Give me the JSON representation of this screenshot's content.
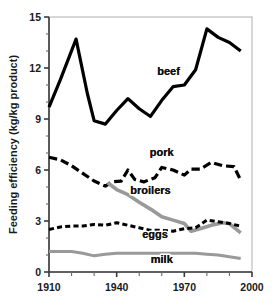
{
  "chart_data": {
    "type": "line",
    "title": "",
    "xlabel": "",
    "ylabel": "Feeding efficiency (kg/kg product)",
    "xlim": [
      1910,
      2000
    ],
    "ylim": [
      0,
      15
    ],
    "grid": false,
    "legend_position": "inline-labels",
    "x_ticks_major": [
      1910,
      1940,
      1970,
      2000
    ],
    "x_tick_labels": [
      "1910",
      "1940",
      "1970",
      "2000"
    ],
    "x_ticks_minor": [
      1920,
      1930,
      1950,
      1960,
      1980,
      1990
    ],
    "y_ticks_major": [
      0,
      3,
      6,
      9,
      12,
      15
    ],
    "y_tick_labels": [
      "0",
      "3",
      "6",
      "9",
      "12",
      "15"
    ],
    "y_ticks_minor": [
      1,
      2,
      4,
      5,
      7,
      8,
      10,
      11,
      13,
      14
    ],
    "series": [
      {
        "name": "beef",
        "color": "#000000",
        "style": "solid",
        "width": 3.2,
        "label_x": 1963,
        "label_y": 11.6,
        "x": [
          1910,
          1915,
          1922,
          1927,
          1930,
          1935,
          1940,
          1945,
          1950,
          1955,
          1960,
          1965,
          1970,
          1975,
          1980,
          1985,
          1990,
          1995
        ],
        "values": [
          9.7,
          11.3,
          13.7,
          10.5,
          8.9,
          8.7,
          9.5,
          10.2,
          9.6,
          9.15,
          10.1,
          10.9,
          11.0,
          11.9,
          14.3,
          13.8,
          13.5,
          13.0
        ]
      },
      {
        "name": "pork",
        "color": "#000000",
        "style": "long-dash",
        "width": 3.2,
        "label_x": 1960,
        "label_y": 6.8,
        "x": [
          1910,
          1915,
          1920,
          1925,
          1930,
          1935,
          1938,
          1942,
          1945,
          1948,
          1952,
          1957,
          1960,
          1965,
          1970,
          1973,
          1977,
          1982,
          1987,
          1992,
          1995
        ],
        "values": [
          6.75,
          6.6,
          6.25,
          5.8,
          5.35,
          5.05,
          5.3,
          5.35,
          6.0,
          5.45,
          5.3,
          5.55,
          6.15,
          6.0,
          5.7,
          6.05,
          6.05,
          6.45,
          6.25,
          6.2,
          5.4
        ]
      },
      {
        "name": "broilers",
        "color": "#999999",
        "style": "solid",
        "width": 3.6,
        "label_x": 1955,
        "label_y": 4.6,
        "x": [
          1936,
          1940,
          1945,
          1950,
          1955,
          1960,
          1965,
          1970,
          1973,
          1977,
          1982,
          1987,
          1990,
          1995
        ],
        "values": [
          5.25,
          4.85,
          4.55,
          4.1,
          3.7,
          3.25,
          3.05,
          2.85,
          2.4,
          2.55,
          2.75,
          2.9,
          2.85,
          2.3
        ]
      },
      {
        "name": "eggs",
        "color": "#000000",
        "style": "short-dash",
        "width": 3.0,
        "label_x": 1957,
        "label_y": 2.0,
        "x": [
          1910,
          1915,
          1920,
          1925,
          1930,
          1935,
          1940,
          1945,
          1950,
          1955,
          1960,
          1965,
          1970,
          1975,
          1980,
          1985,
          1990,
          1995
        ],
        "values": [
          2.5,
          2.65,
          2.7,
          2.7,
          2.8,
          2.75,
          2.9,
          2.75,
          2.6,
          2.45,
          2.45,
          2.4,
          2.55,
          2.6,
          3.05,
          2.95,
          2.85,
          2.7
        ]
      },
      {
        "name": "milk",
        "color": "#999999",
        "style": "solid",
        "width": 3.0,
        "label_x": 1960,
        "label_y": 0.55,
        "x": [
          1910,
          1915,
          1920,
          1925,
          1930,
          1935,
          1940,
          1945,
          1950,
          1955,
          1960,
          1965,
          1970,
          1975,
          1980,
          1985,
          1990,
          1995
        ],
        "values": [
          1.2,
          1.2,
          1.2,
          1.1,
          0.95,
          1.05,
          1.1,
          1.1,
          1.1,
          1.1,
          1.1,
          1.1,
          1.1,
          1.1,
          1.05,
          1.0,
          0.9,
          0.8
        ]
      }
    ]
  },
  "axes": {
    "plot_left": 49,
    "plot_right": 252,
    "plot_top": 17,
    "plot_bottom": 272
  }
}
